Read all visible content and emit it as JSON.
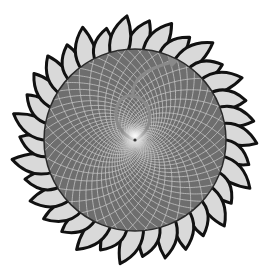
{
  "figure": {
    "width": 264,
    "height": 270,
    "background": "#ffffff",
    "center": {
      "x": 135,
      "y": 140
    },
    "disk": {
      "radius": 91,
      "fill": "#6e6e6e",
      "outline": "#2a2a2a",
      "grid_color": "#c8c8c8",
      "spiral_count_cw": 34,
      "spiral_count_ccw": 55
    },
    "petals": {
      "count": 34,
      "tip_radius": 120,
      "fill": "#d9d9d9",
      "stroke": "#111111",
      "stroke_width": 3
    },
    "overlay": {
      "teardrop_color": "#8a8a8a",
      "arrow_color": "#8a8a8a",
      "center_glow": "#f4f4f4"
    }
  }
}
